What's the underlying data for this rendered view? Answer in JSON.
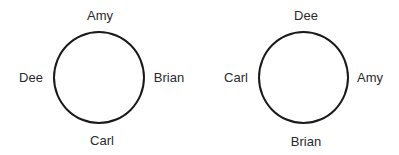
{
  "diagrams": [
    {
      "name": "arrangement-1",
      "circle": {
        "cx": 99,
        "cy": 77,
        "r": 46
      },
      "labels": {
        "top": "Amy",
        "right": "Brian",
        "bottom": "Carl",
        "left": "Dee"
      }
    },
    {
      "name": "arrangement-2",
      "circle": {
        "cx": 303,
        "cy": 77,
        "r": 45
      },
      "labels": {
        "top": "Dee",
        "right": "Amy",
        "bottom": "Brian",
        "left": "Carl"
      }
    }
  ],
  "colors": {
    "stroke": "#1a1a1a",
    "text": "#2a2a2a",
    "background": "#ffffff"
  }
}
